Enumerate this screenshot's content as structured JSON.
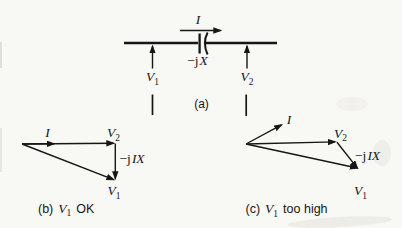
{
  "colors": {
    "ink": "#161616",
    "paper": "#f8f8f5"
  },
  "circuit": {
    "current_label": "I",
    "reactance": {
      "prefix": "−j",
      "var": "X"
    },
    "v1": {
      "base": "V",
      "sub": "1"
    },
    "v2": {
      "base": "V",
      "sub": "2"
    },
    "caption": "(a)"
  },
  "phasor_ok": {
    "current_label": "I",
    "v2": {
      "base": "V",
      "sub": "2"
    },
    "drop": {
      "prefix": "−j",
      "var": "IX"
    },
    "v1": {
      "base": "V",
      "sub": "1"
    },
    "caption": {
      "index": "(b)",
      "v_base": "V",
      "v_sub": "1",
      "verdict": "OK"
    }
  },
  "phasor_high": {
    "current_label": "I",
    "v2": {
      "base": "V",
      "sub": "2"
    },
    "drop": {
      "prefix": "−j",
      "var": "IX"
    },
    "v1": {
      "base": "V",
      "sub": "1"
    },
    "caption": {
      "index": "(c)",
      "v_base": "V",
      "v_sub": "1",
      "verdict": "too high"
    }
  }
}
